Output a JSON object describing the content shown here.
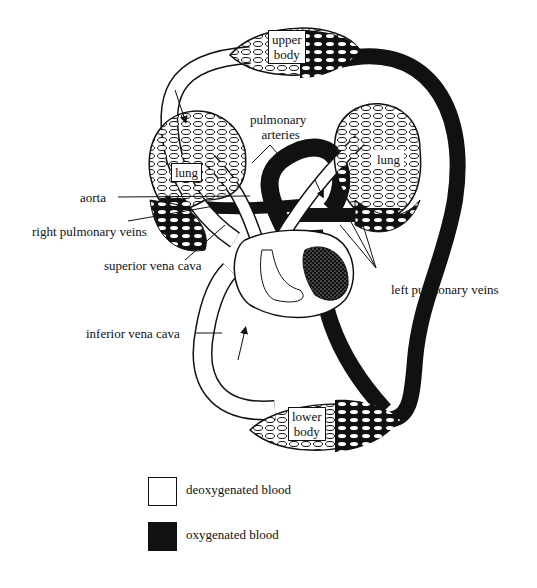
{
  "diagram": {
    "title": "",
    "type": "double circulation (heart, lungs, body)",
    "colors": {
      "deoxygenated": "#ffffff",
      "oxygenated": "#111111",
      "outline": "#111111"
    }
  },
  "regions": {
    "upper_body": {
      "line1": "upper",
      "line2": "body"
    },
    "lower_body": {
      "line1": "lower",
      "line2": "body"
    },
    "lung_left": "lung",
    "lung_right": "lung"
  },
  "labels": {
    "pulmonary_arteries_1": "pulmonary",
    "pulmonary_arteries_2": "arteries",
    "aorta": "aorta",
    "right_pulmonary_veins": "right pulmonary veins",
    "superior_vena_cava": "superior vena cava",
    "inferior_vena_cava": "inferior vena cava",
    "left_pulmonary_veins": "left pulmonary veins"
  },
  "legend": [
    {
      "label": "deoxygenated blood",
      "color": "#ffffff"
    },
    {
      "label": "oxygenated blood",
      "color": "#111111"
    }
  ]
}
